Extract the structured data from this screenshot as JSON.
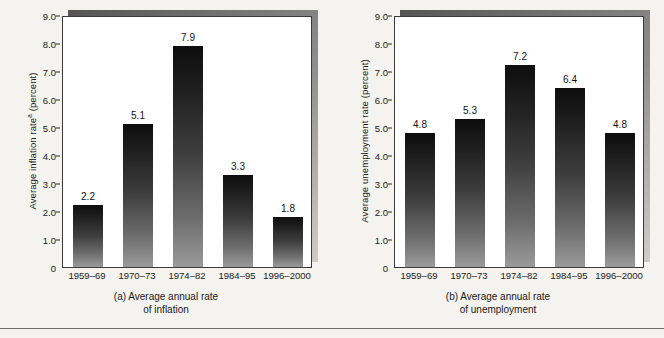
{
  "chart_data": [
    {
      "type": "bar",
      "panel_id": "a",
      "title": "",
      "caption_line1": "(a) Average annual rate",
      "caption_line2": "of inflation",
      "ylabel_main": "Average inflation rate",
      "ylabel_superscript": "a",
      "ylabel_units": " (percent)",
      "xlabel": "",
      "categories": [
        "1959–69",
        "1970–73",
        "1974–82",
        "1984–95",
        "1996–2000"
      ],
      "values": [
        2.2,
        5.1,
        7.9,
        3.3,
        1.8
      ],
      "value_labels": [
        "2.2",
        "5.1",
        "7.9",
        "3.3",
        "1.8"
      ],
      "ylim": [
        0,
        9
      ],
      "ytick_values": [
        0,
        1,
        2,
        3,
        4,
        5,
        6,
        7,
        8,
        9
      ],
      "ytick_labels": [
        "0",
        "1.0",
        "2.0",
        "3.0",
        "4.0",
        "5.0",
        "6.0",
        "7.0",
        "8.0",
        "9.0"
      ],
      "grid": false,
      "legend": "none"
    },
    {
      "type": "bar",
      "panel_id": "b",
      "title": "",
      "caption_line1": "(b) Average annual rate",
      "caption_line2": "of unemployment",
      "ylabel_main": "Average unemployment rate",
      "ylabel_superscript": "",
      "ylabel_units": " (percent)",
      "xlabel": "",
      "categories": [
        "1959–69",
        "1970–73",
        "1974–82",
        "1984–95",
        "1996–2000"
      ],
      "values": [
        4.8,
        5.3,
        7.2,
        6.4,
        4.8
      ],
      "value_labels": [
        "4.8",
        "5.3",
        "7.2",
        "6.4",
        "4.8"
      ],
      "ylim": [
        0,
        9
      ],
      "ytick_values": [
        0,
        1,
        2,
        3,
        4,
        5,
        6,
        7,
        8,
        9
      ],
      "ytick_labels": [
        "0",
        "1.0",
        "2.0",
        "3.0",
        "4.0",
        "5.0",
        "6.0",
        "7.0",
        "8.0",
        "9.0"
      ],
      "grid": false,
      "legend": "none"
    }
  ],
  "colors": {
    "page_background": "#f4f3ef",
    "plot_background": "#ffffff",
    "bar_top": "#0d0d0d",
    "bar_bottom": "#9a9a9a",
    "frame_border": "#3a3a3a",
    "shadow": "#555555",
    "text": "#1a1a1a",
    "rule": "#6d6d6d"
  }
}
